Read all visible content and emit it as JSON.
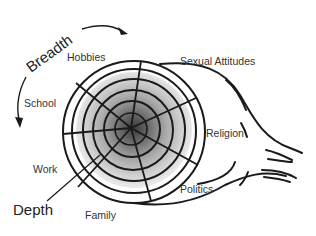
{
  "diagram": {
    "type": "social-penetration-onion",
    "axis_labels": {
      "breadth": "Breadth",
      "depth": "Depth"
    },
    "topics": [
      {
        "label": "Hobbies",
        "x": 92,
        "y": 61
      },
      {
        "label": "Sexual Attitudes",
        "x": 180,
        "y": 65
      },
      {
        "label": "Religion",
        "x": 206,
        "y": 137
      },
      {
        "label": "Politics",
        "x": 181,
        "y": 192
      },
      {
        "label": "Family",
        "x": 84,
        "y": 219
      },
      {
        "label": "Work",
        "x": 32,
        "y": 173
      },
      {
        "label": "School",
        "x": 24,
        "y": 107
      }
    ],
    "rings": 5,
    "center": {
      "x": 134,
      "y": 132
    },
    "outer_radius": 71,
    "colors": {
      "stroke": "#1a1a1a",
      "ring_fills": [
        "#f7f7f7",
        "#e4e4e4",
        "#c9c9c9",
        "#a9a9a9",
        "#808080",
        "#4a4a4a"
      ],
      "text": "#333333"
    }
  }
}
